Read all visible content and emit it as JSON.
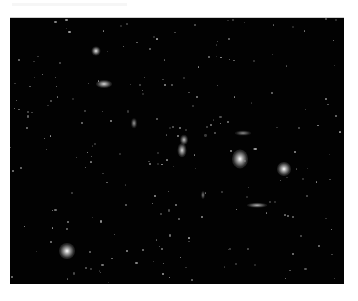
{
  "image": {
    "description": "Deep-sky astronomical photograph of a galaxy field (cluster of galaxies) on black background",
    "background_color": "#020202",
    "frame": {
      "left": 10,
      "top": 17,
      "width": 334,
      "height": 266
    },
    "objects": [
      {
        "name": "galaxy-upper-left",
        "x": 86,
        "y": 33,
        "size": 9,
        "rx": 1,
        "ry": 1,
        "brightness": 0.9
      },
      {
        "name": "galaxy-elliptical-left",
        "x": 94,
        "y": 66,
        "size": 10,
        "rx": 1.6,
        "ry": 0.8,
        "brightness": 0.85
      },
      {
        "name": "galaxy-pair-a",
        "x": 174,
        "y": 122,
        "size": 8,
        "rx": 1,
        "ry": 1.3,
        "brightness": 0.75
      },
      {
        "name": "galaxy-pair-b",
        "x": 172,
        "y": 132,
        "size": 9,
        "rx": 1,
        "ry": 1.5,
        "brightness": 0.85
      },
      {
        "name": "galaxy-small-center",
        "x": 124,
        "y": 105,
        "size": 6,
        "rx": 1,
        "ry": 1.6,
        "brightness": 0.6
      },
      {
        "name": "galaxy-elongated-top",
        "x": 233,
        "y": 115,
        "size": 8,
        "rx": 2,
        "ry": 0.6,
        "brightness": 0.55
      },
      {
        "name": "galaxy-bright-center",
        "x": 230,
        "y": 141,
        "size": 16,
        "rx": 1,
        "ry": 1.2,
        "brightness": 1.0
      },
      {
        "name": "galaxy-bright-right",
        "x": 274,
        "y": 151,
        "size": 14,
        "rx": 1,
        "ry": 1,
        "brightness": 1.0
      },
      {
        "name": "galaxy-edge-on",
        "x": 247,
        "y": 187,
        "size": 9,
        "rx": 2.2,
        "ry": 0.5,
        "brightness": 0.7
      },
      {
        "name": "galaxy-small-lower",
        "x": 193,
        "y": 177,
        "size": 5,
        "rx": 0.8,
        "ry": 1.6,
        "brightness": 0.5
      },
      {
        "name": "bright-star-lower-left",
        "x": 57,
        "y": 233,
        "size": 16,
        "rx": 1,
        "ry": 1,
        "brightness": 1.0
      }
    ]
  }
}
